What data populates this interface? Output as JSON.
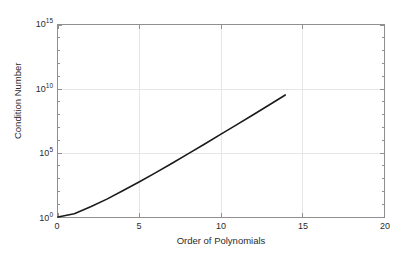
{
  "chart_data": {
    "type": "line",
    "title": "",
    "xlabel": "Order of Polynomials",
    "ylabel": "Condition Number",
    "xlim": [
      0,
      20
    ],
    "ylim": [
      1,
      1000000000000000.0
    ],
    "yscale": "log",
    "xscale": "linear",
    "grid": true,
    "legend": null,
    "xticks": [
      0,
      5,
      10,
      15,
      20
    ],
    "xticklabels": [
      "0",
      "5",
      "10",
      "15",
      "20"
    ],
    "yticks": [
      1,
      100000,
      10000000000,
      1000000000000000
    ],
    "yticklabels": [
      "10",
      "10",
      "10",
      "10"
    ],
    "yticklabel_exponents": [
      "0",
      "5",
      "10",
      "15"
    ],
    "series": [
      {
        "name": "Condition Number",
        "color": "#1a1a1a",
        "linewidth": 1.6,
        "x": [
          0,
          1,
          2,
          3,
          4,
          5,
          6,
          7,
          8,
          9,
          10,
          11,
          12,
          13,
          14,
          15,
          16,
          17,
          18,
          19,
          20
        ],
        "y": [
          1,
          2.5,
          18,
          160,
          1800,
          22000,
          290000,
          4100000,
          61000000,
          950000000,
          15000000000,
          240000000000,
          4000000000000,
          68000000000000,
          1180000000000000,
          2.1e+16,
          3.8e+17,
          7e+18,
          1.3e+20,
          2.4e+21,
          4.6e+22
        ],
        "log10y": [
          0,
          0.4,
          1.25,
          2.2,
          3.26,
          4.34,
          5.46,
          6.61,
          7.79,
          8.98,
          10.18,
          11.38,
          12.6,
          13.83,
          15.07,
          16.32,
          17.58,
          18.85,
          20.11,
          21.38,
          22.66
        ]
      }
    ],
    "plotted_log10_endpoints": {
      "x_start": 0,
      "log10y_start": 0,
      "x_end": 20,
      "log10y_end": 14.4
    }
  },
  "axes": {
    "box_color": "#8f8f8f",
    "grid_color": "#e6e6e6",
    "tick_color": "#8f8f8f",
    "background": "#ffffff"
  }
}
